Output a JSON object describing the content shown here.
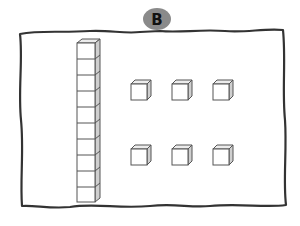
{
  "figure": {
    "label": "B",
    "label_badge_color": "#8a8a8a",
    "frame_color": "#333333",
    "cube_stroke": "#555555",
    "cube_side_fill": "#cfcfcf",
    "cube_top_fill": "#ececec"
  },
  "tens_rod": {
    "cubes": 10,
    "represents": 10
  },
  "ones_cubes": {
    "rows": 2,
    "per_row": 3,
    "count": 6
  }
}
